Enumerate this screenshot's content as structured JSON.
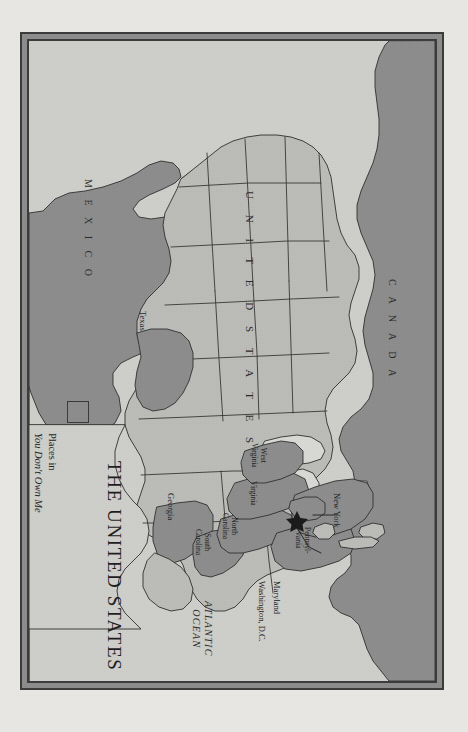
{
  "plate": {
    "title": "THE UNITED STATES",
    "frame_color": "#3b3b3b",
    "frame_band_color": "#8d8d8d",
    "paper_color": "#e9e8e4",
    "map_background_color": "#cfcfcb"
  },
  "legend": {
    "swatch_color": "#8d8d8d",
    "swatch_border_color": "#3a3a3a",
    "line1": "Places in",
    "line2": "You Don't Own Me"
  },
  "map": {
    "colors": {
      "highlight_fill": "#8d8d8d",
      "state_fill": "#bcbcb8",
      "water_fill": "#d9d9d5",
      "outline": "#2f2f2f"
    },
    "country_labels": [
      {
        "name": "MEXICO",
        "text": "M E X I C O"
      },
      {
        "name": "CANADA",
        "text": "C A N A D A"
      },
      {
        "name": "UNITED STATES",
        "text": "U N I T E D   S T A T E S"
      }
    ],
    "ocean_labels": [
      {
        "name": "ATLANTIC OCEAN",
        "line1": "ATLANTIC",
        "line2": "OCEAN"
      }
    ],
    "highlighted_states": [
      {
        "label": "Texas",
        "lines": [
          "Texas"
        ]
      },
      {
        "label": "Georgia",
        "lines": [
          "Georgia"
        ]
      },
      {
        "label": "South Carolina",
        "lines": [
          "South",
          "Carolina"
        ]
      },
      {
        "label": "North Carolina",
        "lines": [
          "North",
          "Carolina"
        ]
      },
      {
        "label": "Virginia",
        "lines": [
          "Virginia"
        ]
      },
      {
        "label": "West Virginia",
        "lines": [
          "West",
          "Virginia"
        ]
      },
      {
        "label": "Pennsylvania",
        "lines": [
          "Pennsyl-",
          "vania"
        ]
      },
      {
        "label": "New York",
        "lines": [
          "New York"
        ]
      },
      {
        "label": "Maryland",
        "lines": [
          "Maryland"
        ]
      }
    ],
    "callouts": [
      {
        "label": "Maryland",
        "text": "Maryland"
      },
      {
        "label": "Washington, D.C.",
        "text": "Washington, D.C."
      }
    ],
    "capital_marker": "star"
  }
}
